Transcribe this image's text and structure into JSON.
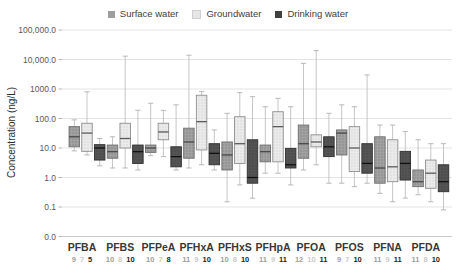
{
  "legend": {
    "items": [
      {
        "label": "Surface water",
        "color": "#9e9e9e"
      },
      {
        "label": "Groundwater",
        "color": "#e6e6e6"
      },
      {
        "label": "Drinking water",
        "color": "#3f3f3f"
      }
    ]
  },
  "y_axis": {
    "title": "Concentration (ng/L)",
    "ticks": [
      {
        "label": "100,000.0",
        "value": 100000
      },
      {
        "label": "10,000.0",
        "value": 10000
      },
      {
        "label": "1000.0",
        "value": 1000
      },
      {
        "label": "100.0",
        "value": 100
      },
      {
        "label": "10.0",
        "value": 10
      },
      {
        "label": "1.0",
        "value": 1
      },
      {
        "label": "0.1",
        "value": 0.1
      },
      {
        "label": "0.0",
        "value": 0.01
      }
    ]
  },
  "chart_data": {
    "type": "boxplot",
    "title": "",
    "ylabel": "Concentration (ng/L)",
    "units": "ng/L",
    "log_scale": true,
    "ylim": [
      0.01,
      100000
    ],
    "grid": true,
    "legend_position": "top",
    "series": [
      "Surface water",
      "Groundwater",
      "Drinking water"
    ],
    "series_colors": {
      "Surface water": "#9e9e9e",
      "Groundwater": "#e6e6e6",
      "Drinking water": "#3f3f3f"
    },
    "count_colors": [
      "#9e9e9e",
      "#c9c9c9",
      "#1f1f1f"
    ],
    "categories": [
      "PFBA",
      "PFBS",
      "PFPeA",
      "PFHxA",
      "PFHxS",
      "PFHpA",
      "PFOA",
      "PFOS",
      "PFNA",
      "PFDA"
    ],
    "sample_counts": [
      [
        9,
        7,
        5
      ],
      [
        10,
        8,
        10
      ],
      [
        10,
        7,
        8
      ],
      [
        11,
        9,
        10
      ],
      [
        10,
        8,
        10
      ],
      [
        11,
        9,
        11
      ],
      [
        12,
        10,
        11
      ],
      [
        9,
        7,
        10
      ],
      [
        11,
        9,
        11
      ],
      [
        11,
        8,
        10
      ]
    ],
    "box_format": [
      "whisker_low",
      "q1",
      "median",
      "q3",
      "whisker_high"
    ],
    "values": [
      [
        [
          8,
          11,
          24,
          53,
          90
        ],
        [
          5.8,
          7.7,
          32,
          69,
          800
        ],
        [
          2.5,
          3.9,
          10,
          13,
          21
        ]
      ],
      [
        [
          2.1,
          4.5,
          7.5,
          12.6,
          24
        ],
        [
          2.1,
          10,
          21,
          69,
          13000
        ],
        [
          1.8,
          3.0,
          7.5,
          12.6,
          190
        ]
      ],
      [
        [
          5.5,
          7.1,
          10,
          12.6,
          330
        ],
        [
          5.1,
          19,
          35,
          69,
          190
        ],
        [
          1.8,
          2.3,
          5.1,
          11,
          290
        ]
      ],
      [
        [
          2.1,
          4.5,
          16,
          47,
          14000
        ],
        [
          2.7,
          8.6,
          78,
          615,
          810
        ],
        [
          1.8,
          2.7,
          6.6,
          14,
          41
        ]
      ],
      [
        [
          0.15,
          1.8,
          5.8,
          16,
          150
        ],
        [
          0.56,
          3.0,
          14,
          115,
          750
        ],
        [
          0.2,
          0.64,
          1.0,
          19,
          550
        ]
      ],
      [
        [
          1.4,
          3.4,
          7.5,
          12.6,
          250
        ],
        [
          1.4,
          3.4,
          53,
          170,
          480
        ],
        [
          0.56,
          2.1,
          2.7,
          9.7,
          250
        ]
      ],
      [
        [
          1.8,
          4.5,
          14,
          60,
          7400
        ],
        [
          2.7,
          11,
          16,
          28,
          20000
        ],
        [
          0.64,
          5.1,
          11,
          24,
          150
        ]
      ],
      [
        [
          0.64,
          5.8,
          32,
          41,
          290
        ],
        [
          0.49,
          1.6,
          10,
          53,
          250
        ],
        [
          0.64,
          1.4,
          3.0,
          14,
          3000
        ]
      ],
      [
        [
          0.29,
          0.64,
          2.1,
          24,
          60
        ],
        [
          0.15,
          0.72,
          2.3,
          19,
          60
        ],
        [
          0.2,
          0.82,
          3.0,
          7.7,
          36
        ]
      ],
      [
        [
          0.26,
          0.49,
          0.72,
          1.8,
          19
        ],
        [
          0.15,
          0.43,
          1.4,
          3.9,
          14
        ],
        [
          0.08,
          0.33,
          0.72,
          2.7,
          14
        ]
      ]
    ]
  }
}
